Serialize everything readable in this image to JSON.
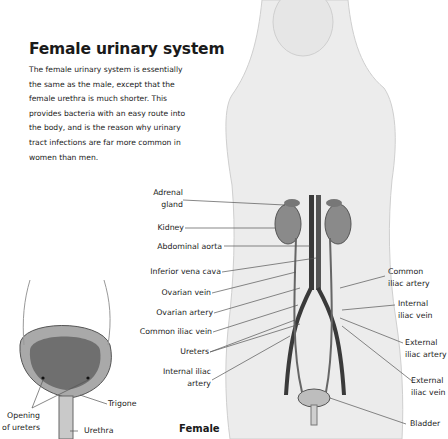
{
  "header": {
    "title": "Female urinary system",
    "intro": "The female urinary system is essentially the same as the male, except that the female urethra is much shorter. This provides bacteria with an easy route into the body, and is the reason why urinary tract infections are far more common in women than men."
  },
  "labels_left": {
    "adrenal_gland": "Adrenal\ngland",
    "kidney": "Kidney",
    "abdominal_aorta": "Abdominal aorta",
    "inferior_vena_cava": "Inferior vena cava",
    "ovarian_vein": "Ovarian vein",
    "ovarian_artery": "Ovarian artery",
    "common_iliac_vein": "Common iliac vein",
    "ureters": "Ureters",
    "internal_iliac_artery": "Internal iliac\nartery"
  },
  "labels_right": {
    "common_iliac_artery": "Common\niliac artery",
    "internal_iliac_vein": "Internal\niliac vein",
    "external_iliac_artery": "External\niliac artery",
    "external_iliac_vein": "External\niliac vein",
    "bladder": "Bladder"
  },
  "inset": {
    "opening_of_ureters": "Opening\nof ureters",
    "trigone": "Trigone",
    "urethra": "Urethra"
  },
  "caption": "Female",
  "colors": {
    "background": "#ffffff",
    "text": "#1a1a1a",
    "leader_line": "#555555",
    "figure_shade": "#d9d9d9",
    "organ": "#8a8a8a",
    "vessel": "#3a3a3a"
  }
}
